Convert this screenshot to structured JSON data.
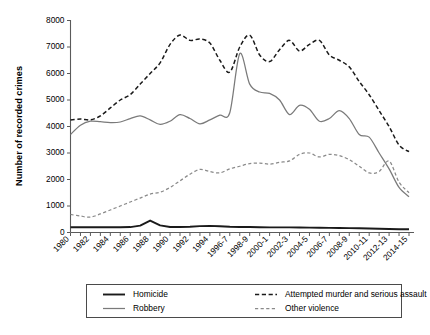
{
  "chart_data": {
    "type": "line",
    "title": "",
    "xlabel": "",
    "ylabel": "Number of recorded crimes",
    "ylim": [
      0,
      8000
    ],
    "ytick_values": [
      0,
      1000,
      2000,
      3000,
      4000,
      5000,
      6000,
      7000,
      8000
    ],
    "ytick_labels": [
      "0",
      "1000",
      "2000",
      "3000",
      "4000",
      "5000",
      "6000",
      "7000",
      "8000"
    ],
    "grid": false,
    "legend_position": "below-plot",
    "x": [
      "1980",
      "1981",
      "1982",
      "1983",
      "1984",
      "1985",
      "1986",
      "1987",
      "1988",
      "1989",
      "1990",
      "1991",
      "1992",
      "1993",
      "1994",
      "1995",
      "1996-7",
      "1997-8",
      "1998-9",
      "1999-0",
      "2000-1",
      "2001-2",
      "2002-3",
      "2003-4",
      "2004-5",
      "2005-6",
      "2006-7",
      "2007-8",
      "2008-9",
      "2009-10",
      "2010-11",
      "2011-12",
      "2012-13",
      "2013-14",
      "2014-15"
    ],
    "xtick_labels": [
      "1980",
      "1982",
      "1984",
      "1986",
      "1988",
      "1990",
      "1992",
      "1994",
      "1996-7",
      "1998-9",
      "2000-1",
      "2002-3",
      "2004-5",
      "2006-7",
      "2008-9",
      "2010-11",
      "2012-13",
      "2014-15"
    ],
    "series": [
      {
        "name": "Homicide",
        "style": "solid",
        "color": "#1a1a1a",
        "width": 1.9,
        "values": [
          200,
          200,
          200,
          200,
          200,
          200,
          205,
          260,
          450,
          270,
          210,
          210,
          215,
          240,
          250,
          235,
          215,
          210,
          205,
          200,
          195,
          195,
          195,
          190,
          185,
          180,
          175,
          170,
          165,
          160,
          150,
          140,
          130,
          125,
          120
        ]
      },
      {
        "name": "Robbery",
        "style": "solid",
        "color": "#7a7a7a",
        "width": 1.25,
        "values": [
          3700,
          4050,
          4200,
          4180,
          4150,
          4170,
          4300,
          4400,
          4250,
          4080,
          4200,
          4450,
          4300,
          4100,
          4250,
          4430,
          4520,
          6750,
          5600,
          5300,
          5250,
          5000,
          4450,
          4800,
          4650,
          4200,
          4300,
          4600,
          4300,
          3700,
          3600,
          3000,
          2400,
          1700,
          1350
        ]
      },
      {
        "name": "Attempted murder and serious assault",
        "style": "dashed",
        "color": "#1a1a1a",
        "width": 1.5,
        "values": [
          4250,
          4280,
          4250,
          4400,
          4700,
          5000,
          5200,
          5600,
          6000,
          6400,
          7100,
          7450,
          7250,
          7300,
          7150,
          6500,
          6050,
          7000,
          7450,
          6700,
          6450,
          6900,
          7250,
          6850,
          7100,
          7250,
          6700,
          6500,
          6250,
          5700,
          5200,
          4600,
          4000,
          3300,
          3050
        ]
      },
      {
        "name": "Other violence",
        "style": "dashed",
        "color": "#8a8a8a",
        "width": 1.25,
        "values": [
          680,
          620,
          580,
          700,
          850,
          1000,
          1150,
          1300,
          1450,
          1520,
          1700,
          1950,
          2200,
          2380,
          2300,
          2250,
          2400,
          2500,
          2600,
          2620,
          2580,
          2650,
          2700,
          2950,
          3000,
          2850,
          2950,
          2900,
          2750,
          2500,
          2250,
          2300,
          2700,
          1900,
          1500
        ]
      }
    ]
  },
  "legend": {
    "entries": [
      {
        "label": "Homicide",
        "style": "solid",
        "color": "#1a1a1a",
        "width": 1.9
      },
      {
        "label": "Attempted murder and serious assault",
        "style": "dashed",
        "color": "#1a1a1a",
        "width": 1.5
      },
      {
        "label": "Robbery",
        "style": "solid",
        "color": "#7a7a7a",
        "width": 1.25
      },
      {
        "label": "Other violence",
        "style": "dashed",
        "color": "#8a8a8a",
        "width": 1.25
      }
    ]
  }
}
